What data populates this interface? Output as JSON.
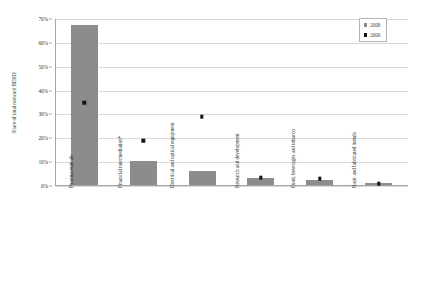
{
  "chart_data": {
    "type": "bar",
    "title": "",
    "subtitle": "",
    "xlabel": "",
    "ylabel": "Share of total outward BERD",
    "ylim": [
      0,
      70
    ],
    "yticks": [
      0,
      10,
      20,
      30,
      40,
      50,
      60,
      70
    ],
    "ytick_labels": [
      "0%",
      "10%",
      "20%",
      "30%",
      "40%",
      "50%",
      "60%",
      "70%"
    ],
    "ytick_suffix": "%",
    "grid": true,
    "legend_position": "top-right",
    "categories": [
      "Pharmaceuticals",
      "Financial intermediation*",
      "Electrical and optical equipment",
      "Research and development",
      "Food, beverages and tobacco",
      "Basic and fabricated metals"
    ],
    "series": [
      {
        "name": "2008",
        "render": "bar",
        "color": "#8c8c8c",
        "values": [
          67,
          10,
          6,
          3,
          2,
          1
        ]
      },
      {
        "name": "2000",
        "render": "marker",
        "color": "#121212",
        "values": [
          35,
          19,
          29,
          3.5,
          3,
          1
        ]
      }
    ]
  },
  "legend": {
    "entries": [
      {
        "label": "2008",
        "swatch": "bar-swatch",
        "color": "#8c8c8c"
      },
      {
        "label": "2000",
        "swatch": "marker-swatch",
        "color": "#121212"
      }
    ]
  },
  "colors": {
    "bar": "#8c8c8c",
    "marker": "#121212",
    "gridline": "#d9d9d9",
    "axis": "#a6a6a6",
    "text": "#3a3a3a",
    "background": "#ffffff"
  }
}
